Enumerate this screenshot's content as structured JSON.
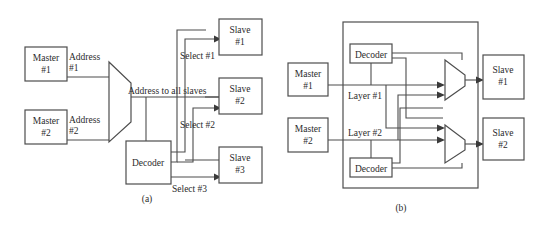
{
  "figure": {
    "background_color": "#ffffff",
    "line_color": "#4d4d4d",
    "text_color": "#2b2b2b"
  },
  "panel_a": {
    "caption": "(a)",
    "masters": [
      {
        "line1": "Master",
        "line2": "#1"
      },
      {
        "line1": "Master",
        "line2": "#2"
      }
    ],
    "address_labels": [
      {
        "line1": "Address",
        "line2": "#1"
      },
      {
        "line1": "Address",
        "line2": "#2"
      }
    ],
    "bus_label": "Address to all slaves",
    "decoder_label": "Decoder",
    "select_labels": [
      "Select #1",
      "Select #2",
      "Select #3"
    ],
    "slaves": [
      {
        "line1": "Slave",
        "line2": "#1"
      },
      {
        "line1": "Slave",
        "line2": "#2"
      },
      {
        "line1": "Slave",
        "line2": "#3"
      }
    ]
  },
  "panel_b": {
    "caption": "(b)",
    "masters": [
      {
        "line1": "Master",
        "line2": "#1"
      },
      {
        "line1": "Master",
        "line2": "#2"
      }
    ],
    "decoders": [
      "Decoder",
      "Decoder"
    ],
    "layer_labels": [
      "Layer #1",
      "Layer #2"
    ],
    "slaves": [
      {
        "line1": "Slave",
        "line2": "#1"
      },
      {
        "line1": "Slave",
        "line2": "#2"
      }
    ]
  }
}
